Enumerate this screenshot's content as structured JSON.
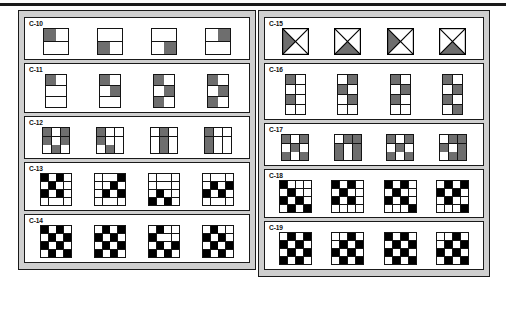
{
  "document": {
    "rule_color": "#1a1a1a",
    "panel_bg": "#cfcfcf",
    "ink": "#000000",
    "gray_fill": "#6e6e6e"
  },
  "panels": [
    {
      "id": "panel-left",
      "groups": [
        {
          "label": "C-10",
          "type": "grid",
          "cols": 2,
          "rows": 2,
          "cell": 12,
          "figures": [
            {
              "fill": "gray",
              "cells": [
                1,
                0,
                0,
                0
              ]
            },
            {
              "fill": "gray",
              "cells": [
                0,
                0,
                1,
                0
              ]
            },
            {
              "fill": "gray",
              "cells": [
                0,
                0,
                0,
                1
              ]
            },
            {
              "fill": "gray",
              "cells": [
                0,
                1,
                0,
                0
              ]
            }
          ]
        },
        {
          "label": "C-11",
          "type": "grid",
          "cols": 2,
          "rows": 3,
          "cell": 10,
          "figures": [
            {
              "fill": "gray",
              "cells": [
                1,
                0,
                0,
                0,
                0,
                0
              ]
            },
            {
              "fill": "gray",
              "cells": [
                1,
                0,
                0,
                1,
                0,
                0
              ]
            },
            {
              "fill": "gray",
              "cells": [
                1,
                0,
                0,
                1,
                1,
                0
              ]
            },
            {
              "fill": "gray",
              "cells": [
                1,
                0,
                0,
                1,
                1,
                0,
                0,
                1
              ]
            }
          ]
        },
        {
          "label": "C-12",
          "type": "grid",
          "cols": 3,
          "rows": 3,
          "cell": 8,
          "figures": [
            {
              "fill": "gray",
              "cells": [
                1,
                0,
                1,
                1,
                0,
                1,
                0,
                1,
                0
              ]
            },
            {
              "fill": "gray",
              "cells": [
                1,
                0,
                0,
                1,
                0,
                0,
                0,
                1,
                0
              ]
            },
            {
              "fill": "gray",
              "cells": [
                0,
                1,
                0,
                0,
                1,
                0,
                0,
                1,
                0
              ]
            },
            {
              "fill": "gray",
              "cells": [
                1,
                0,
                0,
                1,
                0,
                0,
                1,
                0,
                0
              ]
            }
          ]
        },
        {
          "label": "C-13",
          "type": "grid",
          "cols": 4,
          "rows": 4,
          "cell": 7,
          "figures": [
            {
              "fill": "black",
              "cells": [
                1,
                0,
                1,
                0,
                0,
                1,
                0,
                0,
                1,
                0,
                1,
                0,
                0,
                0,
                0,
                0
              ]
            },
            {
              "fill": "black",
              "cells": [
                0,
                0,
                0,
                1,
                0,
                0,
                1,
                0,
                0,
                1,
                0,
                1,
                0,
                0,
                0,
                0
              ]
            },
            {
              "fill": "black",
              "cells": [
                0,
                0,
                0,
                0,
                0,
                0,
                0,
                0,
                0,
                1,
                0,
                0,
                1,
                0,
                1,
                0
              ]
            },
            {
              "fill": "black",
              "cells": [
                0,
                0,
                0,
                0,
                0,
                1,
                0,
                1,
                1,
                0,
                1,
                0,
                0,
                0,
                0,
                0
              ]
            }
          ]
        },
        {
          "label": "C-14",
          "type": "grid",
          "cols": 4,
          "rows": 4,
          "cell": 7,
          "figures": [
            {
              "fill": "black",
              "cells": [
                1,
                0,
                1,
                0,
                0,
                1,
                0,
                1,
                1,
                0,
                1,
                0,
                0,
                1,
                0,
                1
              ]
            },
            {
              "fill": "black",
              "cells": [
                0,
                1,
                0,
                1,
                1,
                0,
                1,
                0,
                0,
                1,
                0,
                1,
                1,
                0,
                1,
                0
              ]
            },
            {
              "fill": "black",
              "cells": [
                0,
                1,
                0,
                0,
                1,
                0,
                0,
                0,
                0,
                1,
                0,
                1,
                1,
                0,
                1,
                0
              ]
            },
            {
              "fill": "black",
              "cells": [
                0,
                1,
                0,
                0,
                1,
                0,
                1,
                0,
                0,
                1,
                0,
                1,
                1,
                0,
                1,
                0
              ]
            }
          ]
        }
      ]
    },
    {
      "id": "panel-right",
      "groups": [
        {
          "label": "C-15",
          "type": "cross",
          "size": 27,
          "figures": [
            {
              "shaded": "left"
            },
            {
              "shaded": "bottom"
            },
            {
              "shaded": "left"
            },
            {
              "shaded": "bottom"
            }
          ]
        },
        {
          "label": "C-16",
          "type": "grid",
          "cols": 2,
          "rows": 4,
          "cell": 9,
          "figures": [
            {
              "fill": "gray",
              "cells": [
                1,
                0,
                0,
                0,
                1,
                0,
                0,
                0
              ]
            },
            {
              "fill": "gray",
              "cells": [
                0,
                1,
                1,
                0,
                0,
                1,
                0,
                0
              ]
            },
            {
              "fill": "gray",
              "cells": [
                1,
                0,
                0,
                1,
                1,
                0,
                0,
                0
              ]
            },
            {
              "fill": "gray",
              "cells": [
                1,
                0,
                0,
                1,
                1,
                0,
                0,
                1
              ]
            }
          ]
        },
        {
          "label": "C-17",
          "type": "grid",
          "cols": 3,
          "rows": 3,
          "cell": 8,
          "figures": [
            {
              "fill": "gray",
              "cells": [
                1,
                0,
                1,
                0,
                1,
                0,
                1,
                0,
                1
              ]
            },
            {
              "fill": "gray",
              "cells": [
                0,
                1,
                1,
                1,
                0,
                1,
                1,
                0,
                1
              ]
            },
            {
              "fill": "gray",
              "cells": [
                1,
                0,
                1,
                0,
                1,
                0,
                1,
                0,
                1
              ]
            },
            {
              "fill": "gray",
              "cells": [
                0,
                1,
                1,
                1,
                0,
                1,
                0,
                1,
                1
              ]
            }
          ]
        },
        {
          "label": "C-18",
          "type": "grid",
          "cols": 4,
          "rows": 4,
          "cell": 7,
          "figures": [
            {
              "fill": "black",
              "cells": [
                1,
                0,
                0,
                0,
                0,
                1,
                0,
                0,
                1,
                0,
                1,
                0,
                0,
                1,
                0,
                1
              ]
            },
            {
              "fill": "black",
              "cells": [
                1,
                0,
                1,
                0,
                0,
                1,
                0,
                0,
                1,
                0,
                1,
                0,
                0,
                0,
                0,
                0
              ]
            },
            {
              "fill": "black",
              "cells": [
                1,
                0,
                1,
                0,
                0,
                1,
                0,
                0,
                1,
                0,
                1,
                0,
                0,
                0,
                0,
                1
              ]
            },
            {
              "fill": "black",
              "cells": [
                0,
                1,
                0,
                1,
                1,
                0,
                1,
                0,
                0,
                1,
                0,
                0,
                0,
                0,
                0,
                1
              ]
            }
          ]
        },
        {
          "label": "C-19",
          "type": "grid",
          "cols": 4,
          "rows": 4,
          "cell": 7,
          "figures": [
            {
              "fill": "black",
              "cells": [
                0,
                1,
                0,
                1,
                1,
                0,
                1,
                0,
                0,
                1,
                0,
                1,
                1,
                0,
                1,
                0
              ]
            },
            {
              "fill": "black",
              "cells": [
                0,
                0,
                1,
                0,
                0,
                1,
                0,
                1,
                1,
                0,
                1,
                0,
                0,
                1,
                0,
                1
              ]
            },
            {
              "fill": "black",
              "cells": [
                1,
                0,
                1,
                0,
                0,
                1,
                0,
                1,
                1,
                0,
                1,
                0,
                0,
                1,
                0,
                1
              ]
            },
            {
              "fill": "black",
              "cells": [
                0,
                0,
                1,
                0,
                0,
                1,
                0,
                1,
                1,
                0,
                1,
                0,
                0,
                1,
                0,
                1
              ]
            }
          ]
        }
      ]
    }
  ]
}
